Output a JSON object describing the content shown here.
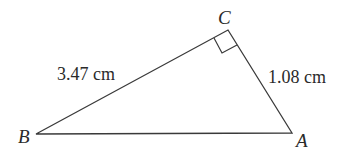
{
  "diagram": {
    "type": "right-triangle",
    "stroke_color": "#3a3a3a",
    "text_color": "#2a2a2a",
    "vertices": {
      "A": {
        "label": "A",
        "x": 292,
        "y": 133
      },
      "B": {
        "label": "B",
        "x": 36,
        "y": 134
      },
      "C": {
        "label": "C",
        "x": 228,
        "y": 30
      }
    },
    "right_angle_at": "C",
    "sides": {
      "BC": {
        "label": "3.47 cm"
      },
      "CA": {
        "label": "1.08 cm"
      }
    }
  }
}
